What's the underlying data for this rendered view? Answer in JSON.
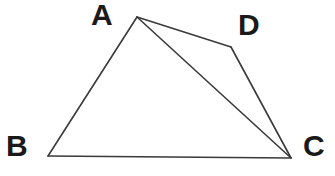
{
  "figure": {
    "kind": "geometry-diagram",
    "background_color": "#ffffff",
    "stroke_color": "#3a3a3a",
    "label_color": "#1a1a1a",
    "stroke_width": 1.6,
    "canvas": {
      "width": 335,
      "height": 176
    },
    "vertices": [
      {
        "id": "A",
        "label": "A",
        "x": 137,
        "y": 17,
        "label_x": 91,
        "label_y": 0
      },
      {
        "id": "B",
        "label": "B",
        "x": 48,
        "y": 156,
        "label_x": 6,
        "label_y": 131
      },
      {
        "id": "C",
        "label": "C",
        "x": 291,
        "y": 158,
        "label_x": 303,
        "label_y": 131
      },
      {
        "id": "D",
        "label": "D",
        "x": 231,
        "y": 47,
        "label_x": 238,
        "label_y": 10
      }
    ],
    "edges": [
      {
        "id": "AB",
        "from": "A",
        "to": "B",
        "kind": "side"
      },
      {
        "id": "BC",
        "from": "B",
        "to": "C",
        "kind": "side"
      },
      {
        "id": "AD",
        "from": "A",
        "to": "D",
        "kind": "side"
      },
      {
        "id": "DC",
        "from": "D",
        "to": "C",
        "kind": "side"
      },
      {
        "id": "AC",
        "from": "A",
        "to": "C",
        "kind": "diagonal"
      }
    ],
    "labels": {
      "A": "A",
      "B": "B",
      "C": "C",
      "D": "D"
    }
  }
}
